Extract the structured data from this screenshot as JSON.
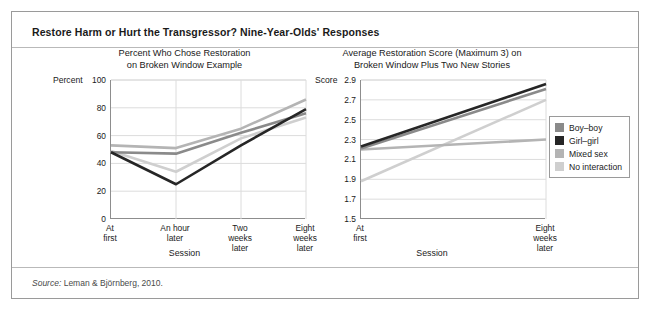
{
  "figure": {
    "title": "Restore Harm or Hurt the Transgressor? Nine-Year-Olds' Responses",
    "source_word": "Source:",
    "source_text": " Leman & Björnberg, 2010."
  },
  "legend": {
    "items": [
      {
        "label": "Boy–boy",
        "color": "#8a8a8a"
      },
      {
        "label": "Girl–girl",
        "color": "#262626"
      },
      {
        "label": "Mixed sex",
        "color": "#b4b4b4"
      },
      {
        "label": "No interaction",
        "color": "#cfcfcf"
      }
    ]
  },
  "chart_data": [
    {
      "type": "line",
      "id": "left",
      "title": "Percent Who Chose Restoration\non Broken Window Example",
      "title_line1": "Percent Who Chose Restoration",
      "title_line2": "on Broken Window Example",
      "xlabel": "Session",
      "ylabel": "Percent",
      "ylim": [
        0,
        100
      ],
      "yticks": [
        0,
        20,
        40,
        60,
        80,
        100
      ],
      "ytick_labels": [
        "0",
        "20",
        "40",
        "60",
        "80",
        "100"
      ],
      "grid": true,
      "legend_position": "outside-right",
      "categories": [
        "At\nfirst",
        "An hour\nlater",
        "Two\nweeks\nlater",
        "Eight\nweeks\nlater"
      ],
      "series": [
        {
          "name": "Boy–boy",
          "color": "#8a8a8a",
          "values": [
            48,
            47,
            62,
            76
          ]
        },
        {
          "name": "Girl–girl",
          "color": "#262626",
          "values": [
            48,
            25,
            53,
            79
          ]
        },
        {
          "name": "Mixed sex",
          "color": "#b4b4b4",
          "values": [
            53,
            51,
            65,
            86
          ]
        },
        {
          "name": "No interaction",
          "color": "#cfcfcf",
          "values": [
            49,
            34,
            58,
            73
          ]
        }
      ]
    },
    {
      "type": "line",
      "id": "right",
      "title": "Average Restoration Score (Maximum 3) on\nBroken Window Plus Two New Stories",
      "title_line1": "Average Restoration Score (Maximum 3) on",
      "title_line2": "Broken Window Plus Two New Stories",
      "xlabel": "Session",
      "ylabel": "Score",
      "ylim": [
        1.5,
        2.9
      ],
      "yticks": [
        1.5,
        1.7,
        1.9,
        2.1,
        2.3,
        2.5,
        2.7,
        2.9
      ],
      "ytick_labels": [
        "1.5",
        "1.7",
        "1.9",
        "2.1",
        "2.3",
        "2.5",
        "2.7",
        "2.9"
      ],
      "grid": true,
      "legend_position": "outside-right",
      "categories": [
        "At\nfirst",
        "Eight\nweeks\nlater"
      ],
      "series": [
        {
          "name": "Boy–boy",
          "color": "#8a8a8a",
          "values": [
            2.21,
            2.81
          ]
        },
        {
          "name": "Girl–girl",
          "color": "#262626",
          "values": [
            2.23,
            2.86
          ]
        },
        {
          "name": "Mixed sex",
          "color": "#b4b4b4",
          "values": [
            2.2,
            2.3
          ]
        },
        {
          "name": "No interaction",
          "color": "#cfcfcf",
          "values": [
            1.88,
            2.7
          ]
        }
      ]
    }
  ]
}
